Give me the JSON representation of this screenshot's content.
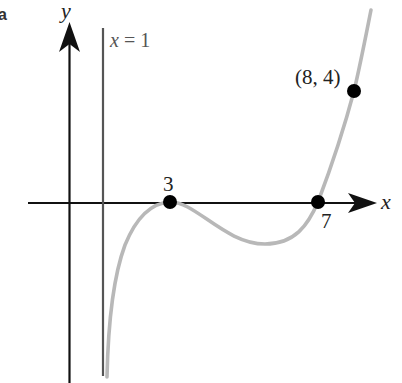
{
  "figure": {
    "part_label": "a",
    "axes": {
      "x_label": "x",
      "y_label": "y"
    },
    "asymptote": {
      "label": "x = 1",
      "x": 1
    },
    "points": [
      {
        "label": "3",
        "x": 3,
        "y": 0
      },
      {
        "label": "7",
        "x": 7,
        "y": 0
      },
      {
        "label": "(8, 4)",
        "x": 8,
        "y": 4
      }
    ],
    "colors": {
      "axes": "#111111",
      "asymptote": "#555555",
      "curve": "#b8b8b8",
      "points": "#000000"
    }
  }
}
